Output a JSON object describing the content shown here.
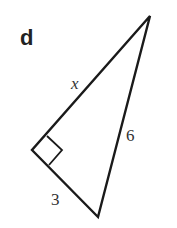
{
  "figure": {
    "part_label": "d",
    "hypotenuse_label": "6",
    "leg_long_label": "x",
    "leg_short_label": "3",
    "right_angle_marker": true
  },
  "colors": {
    "stroke": "#1a1a1a",
    "background": "#ffffff"
  }
}
